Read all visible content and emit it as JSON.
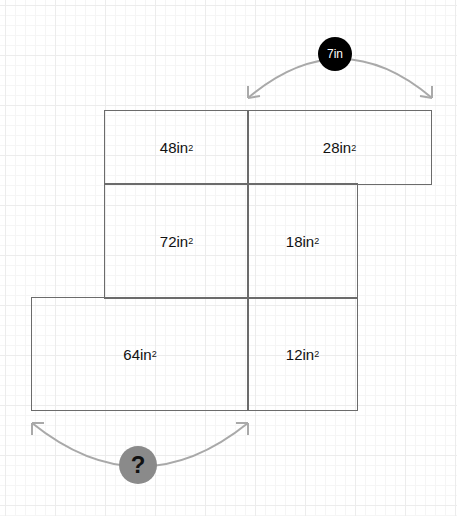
{
  "regions": [
    {
      "id": "r1",
      "label": "48in",
      "sup": "2",
      "x": 104,
      "y": 110,
      "w": 145,
      "h": 75
    },
    {
      "id": "r2",
      "label": "28in",
      "sup": "2",
      "x": 247,
      "y": 110,
      "w": 185,
      "h": 75
    },
    {
      "id": "r3",
      "label": "72in",
      "sup": "2",
      "x": 104,
      "y": 183,
      "w": 145,
      "h": 116
    },
    {
      "id": "r4",
      "label": "18in",
      "sup": "2",
      "x": 247,
      "y": 183,
      "w": 111,
      "h": 116
    },
    {
      "id": "r5",
      "label": "64in",
      "sup": "2",
      "x": 31,
      "y": 297,
      "w": 218,
      "h": 114
    },
    {
      "id": "r6",
      "label": "12in",
      "sup": "2",
      "x": 247,
      "y": 297,
      "w": 111,
      "h": 114
    }
  ],
  "top_measure": {
    "label": "7in",
    "color": "#000000"
  },
  "bottom_measure": {
    "label": "?",
    "color": "#8a8a8a"
  },
  "arc_color": "#a9a9a9"
}
